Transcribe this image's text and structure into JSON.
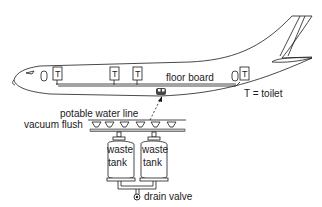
{
  "diagram": {
    "colors": {
      "line": "#1a1a1a",
      "background": "#ffffff",
      "pipe_gray": "#bdbdbd"
    },
    "labels": {
      "floor_board": "floor board",
      "legend": "T = toilet",
      "potable_water_line": "potable water line",
      "vacuum_flush": "vacuum flush",
      "waste_tank_word1": "waste",
      "waste_tank_word2": "tank",
      "drain_valve": "drain valve"
    },
    "toilets": [
      {
        "label": "T",
        "x": 55
      },
      {
        "label": "T",
        "x": 112
      },
      {
        "label": "T",
        "x": 135
      },
      {
        "label": "T",
        "x": 243
      }
    ],
    "waste_tanks": [
      {
        "line1": "waste",
        "line2": "tank"
      },
      {
        "line1": "waste",
        "line2": "tank"
      }
    ],
    "vacuum_flush_bowls": 6
  }
}
